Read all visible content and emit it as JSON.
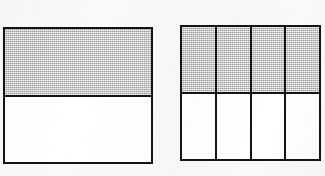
{
  "figure": {
    "kind": "fraction-area-models",
    "background_color": "#f9f9f7",
    "line_color": "#141414",
    "shaded_color": "#c9c9c9",
    "unshaded_color": "#ffffff",
    "models": [
      {
        "id": "halves",
        "name": "left-rectangle",
        "rows": 2,
        "columns": 1,
        "total_parts": 2,
        "shaded_parts": 1,
        "fraction": "1/2",
        "orientation": "horizontal",
        "cells": [
          {
            "index": 1,
            "state": "shaded"
          },
          {
            "index": 2,
            "state": "unshaded"
          }
        ]
      },
      {
        "id": "eighths",
        "name": "right-rectangle",
        "rows": 2,
        "columns": 4,
        "total_parts": 8,
        "shaded_parts": 4,
        "fraction": "4/8",
        "orientation": "grid",
        "columns_cells": [
          {
            "column": 1,
            "cells": [
              {
                "index": 1,
                "state": "shaded"
              },
              {
                "index": 5,
                "state": "unshaded"
              }
            ]
          },
          {
            "column": 2,
            "cells": [
              {
                "index": 2,
                "state": "shaded"
              },
              {
                "index": 6,
                "state": "unshaded"
              }
            ]
          },
          {
            "column": 3,
            "cells": [
              {
                "index": 3,
                "state": "shaded"
              },
              {
                "index": 7,
                "state": "unshaded"
              }
            ]
          },
          {
            "column": 4,
            "cells": [
              {
                "index": 4,
                "state": "shaded"
              },
              {
                "index": 8,
                "state": "unshaded"
              }
            ]
          }
        ]
      }
    ]
  }
}
